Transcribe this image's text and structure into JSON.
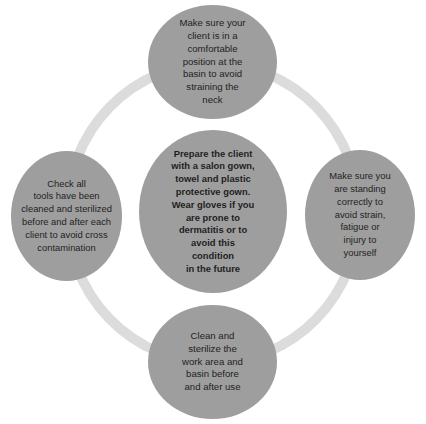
{
  "diagram": {
    "type": "cycle",
    "colors": {
      "node_fill": "#9e9e9e",
      "ring_stroke": "#dcdcdc",
      "text": "#1e1e1e",
      "background": "#ffffff"
    },
    "center": {
      "text": "Prepare the client\nwith a salon gown,\ntowel and plastic\nprotective gown.\nWear gloves if you\nare prone to\ndermatitis or to\navoid this\ncondition\nin the future"
    },
    "nodes": {
      "top": {
        "text": "Make sure your\nclient is in a\ncomfortable\nposition at the\nbasin to avoid\nstraining the\nneck"
      },
      "right": {
        "text": "Make sure you\nare standing\ncorrectly to\navoid strain,\nfatigue or\ninjury to\nyourself"
      },
      "bottom": {
        "text": "Clean and\nsterilize the\nwork area and\nbasin before\nand after use"
      },
      "left": {
        "text": "Check all\ntools have been\ncleaned and sterilized\nbefore and after each\nclient to avoid cross\ncontamination"
      }
    }
  }
}
